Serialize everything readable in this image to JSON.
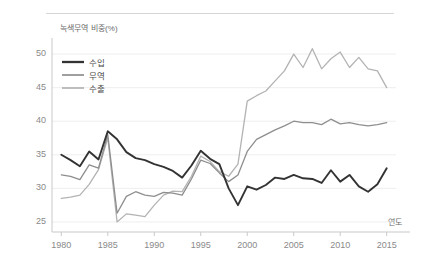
{
  "figure": {
    "axis_title": "녹색무역 비중(%)",
    "xaxis_title": "연도"
  },
  "legend": {
    "items": [
      {
        "label": "수입",
        "color": "#333333",
        "width": 1.9
      },
      {
        "label": "무역",
        "color": "#8e8e8e",
        "width": 1.3
      },
      {
        "label": "수출",
        "color": "#b3b3b3",
        "width": 1.3
      }
    ]
  },
  "chart_data": {
    "type": "line",
    "title": "녹색무역 비중(%)",
    "xlabel": "연도",
    "ylabel": "녹색무역 비중(%)",
    "xlim": [
      1979,
      2016
    ],
    "ylim": [
      23.5,
      51.5
    ],
    "xticks": [
      1980,
      1985,
      1990,
      1995,
      2000,
      2005,
      2010,
      2015
    ],
    "yticks": [
      25,
      30,
      35,
      40,
      45,
      50
    ],
    "grid": "horizontal",
    "legend_position": "upper-left-inside",
    "x": [
      1980,
      1981,
      1982,
      1983,
      1984,
      1985,
      1986,
      1987,
      1988,
      1989,
      1990,
      1991,
      1992,
      1993,
      1994,
      1995,
      1996,
      1997,
      1998,
      1999,
      2000,
      2001,
      2002,
      2003,
      2004,
      2005,
      2006,
      2007,
      2008,
      2009,
      2010,
      2011,
      2012,
      2013,
      2014,
      2015
    ],
    "series": [
      {
        "name": "수입",
        "color": "#333333",
        "values": [
          35.0,
          34.2,
          33.3,
          35.5,
          34.3,
          38.5,
          37.3,
          35.4,
          34.5,
          34.2,
          33.6,
          33.2,
          32.6,
          31.6,
          33.4,
          35.6,
          34.4,
          33.6,
          30.0,
          27.5,
          30.3,
          29.8,
          30.5,
          31.6,
          31.4,
          32.0,
          31.5,
          31.4,
          30.8,
          32.7,
          31.0,
          32.0,
          30.3,
          29.5,
          30.6,
          33.0
        ]
      },
      {
        "name": "무역",
        "color": "#8e8e8e",
        "values": [
          32.0,
          31.8,
          31.3,
          33.5,
          33.0,
          38.0,
          26.3,
          28.8,
          29.5,
          29.0,
          28.8,
          29.4,
          29.3,
          29.0,
          31.4,
          34.2,
          33.7,
          32.3,
          31.0,
          32.0,
          35.5,
          37.3,
          38.0,
          38.7,
          39.3,
          40.0,
          39.8,
          39.8,
          39.5,
          40.3,
          39.6,
          39.8,
          39.5,
          39.3,
          39.5,
          39.8
        ]
      },
      {
        "name": "수출",
        "color": "#b3b3b3",
        "values": [
          28.5,
          28.7,
          29.0,
          30.6,
          32.8,
          37.5,
          25.0,
          26.2,
          26.0,
          25.8,
          27.5,
          29.0,
          29.6,
          29.5,
          31.8,
          34.8,
          34.0,
          32.5,
          31.8,
          33.6,
          43.0,
          43.8,
          44.5,
          46.0,
          47.5,
          50.0,
          48.0,
          50.8,
          47.8,
          49.3,
          50.3,
          48.0,
          49.5,
          47.8,
          47.5,
          45.0
        ]
      }
    ]
  }
}
